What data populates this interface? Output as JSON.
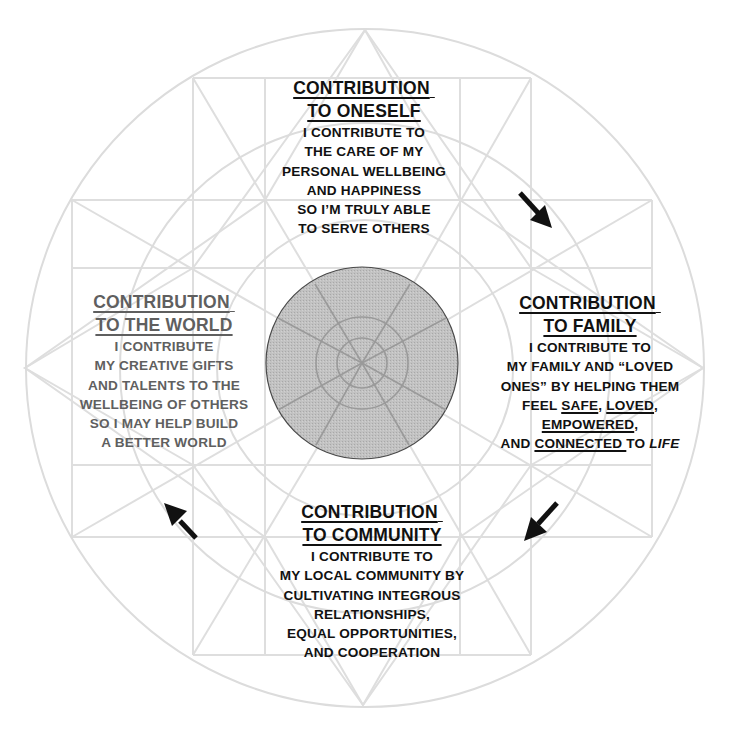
{
  "diagram": {
    "type": "circular contribution cycle",
    "colors": {
      "background": "#ffffff",
      "grid_lines": "#dcdcdc",
      "center_fill": "#b8b8b8",
      "center_stroke": "#555555",
      "text_primary": "#111111",
      "text_secondary": "#5f5f5f",
      "arrows": "#111111"
    },
    "flow_direction": "clockwise",
    "sections": {
      "oneself": {
        "position": "top",
        "title_line1": "CONTRIBUTION",
        "title_line2": "TO ONESELF",
        "lines": [
          "I CONTRIBUTE TO",
          "THE CARE OF MY",
          "PERSONAL WELLBEING",
          "AND HAPPINESS",
          "SO I’M TRULY ABLE",
          "TO SERVE OTHERS"
        ]
      },
      "family": {
        "position": "right",
        "title_line1": "CONTRIBUTION",
        "title_line2": "TO FAMILY",
        "lines": [
          "I CONTRIBUTE TO",
          "MY FAMILY AND “LOVED",
          "ONES” BY HELPING THEM"
        ],
        "line4_prefix": "FEEL ",
        "line4_u1": "SAFE",
        "line4_sep": ", ",
        "line4_u2": "LOVED",
        "line4_suffix": ",",
        "line5_u": "EMPOWERED",
        "line5_suffix": ",",
        "line6_prefix": "AND ",
        "line6_u": "CONNECTED ",
        "line6_mid": "TO ",
        "line6_italic": "LIFE"
      },
      "community": {
        "position": "bottom",
        "title_line1": "CONTRIBUTION",
        "title_line2": "TO COMMUNITY",
        "lines": [
          "I CONTRIBUTE TO",
          "MY LOCAL COMMUNITY BY",
          "CULTIVATING INTEGROUS",
          "RELATIONSHIPS,",
          "EQUAL OPPORTUNITIES,",
          "AND COOPERATION"
        ]
      },
      "world": {
        "position": "left",
        "title_line1": "CONTRIBUTION",
        "title_line2": "TO THE WORLD",
        "lines": [
          "I CONTRIBUTE",
          "MY CREATIVE GIFTS",
          "AND TALENTS TO THE",
          "WELLBEING OF OTHERS",
          "SO I MAY HELP BUILD",
          "A BETTER WORLD"
        ]
      }
    },
    "arrows": [
      {
        "name": "oneself-to-family",
        "direction": "down-right"
      },
      {
        "name": "family-to-community",
        "direction": "down-left"
      },
      {
        "name": "community-to-world",
        "direction": "up-left"
      }
    ]
  }
}
